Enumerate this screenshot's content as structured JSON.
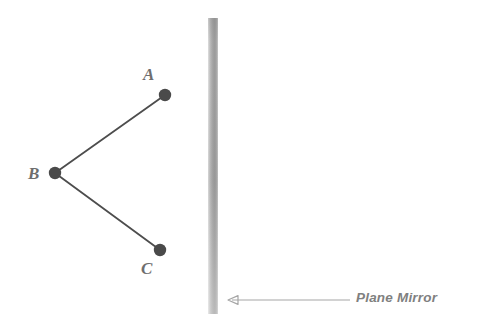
{
  "figure": {
    "background_color": "#ffffff",
    "width": 479,
    "height": 331,
    "points": [
      {
        "id": "A",
        "label": "A",
        "x": 165,
        "y": 95,
        "label_x": 148,
        "label_y": 74
      },
      {
        "id": "B",
        "label": "B",
        "x": 55,
        "y": 173,
        "label_x": 35,
        "label_y": 173
      },
      {
        "id": "C",
        "label": "C",
        "x": 160,
        "y": 250,
        "label_x": 147,
        "label_y": 268
      }
    ],
    "segments": [
      {
        "from": "B",
        "to": "A",
        "x1": 55,
        "y1": 173,
        "x2": 165,
        "y2": 95
      },
      {
        "from": "B",
        "to": "C",
        "x1": 55,
        "y1": 173,
        "x2": 160,
        "y2": 250
      }
    ],
    "mirror": {
      "caption": "Plane Mirror",
      "x": 208,
      "y": 18,
      "width": 10,
      "height": 296,
      "color_light": "#e3e3e3",
      "color_dark": "#9a9a9a"
    },
    "annotation_arrow": {
      "x_start": 350,
      "x_end": 228,
      "y": 300,
      "color": "#a0a0a0",
      "direction": "left"
    },
    "colors": {
      "dot": "#4a4a4a",
      "line": "#4d4d4d",
      "label": "#6e6e6e",
      "caption": "#808080"
    }
  }
}
